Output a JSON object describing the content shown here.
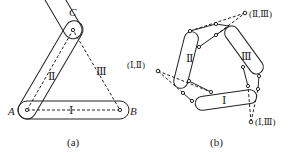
{
  "figure_a": {
    "caption": "(a)",
    "vertices": {
      "A": "A",
      "B": "B",
      "C": "C"
    },
    "links": {
      "I": "Ⅰ",
      "II": "Ⅱ",
      "III": "Ⅲ"
    }
  },
  "figure_b": {
    "caption": "(b)",
    "links": {
      "I": "Ⅰ",
      "II": "Ⅱ",
      "III": "Ⅲ"
    },
    "instant_centers": {
      "I_II": "(Ⅰ,Ⅱ)",
      "II_III": "(Ⅱ,Ⅲ)",
      "I_III": "(Ⅰ,Ⅲ)"
    }
  },
  "colors": {
    "stroke": "#222222",
    "background": "#ffffff"
  }
}
